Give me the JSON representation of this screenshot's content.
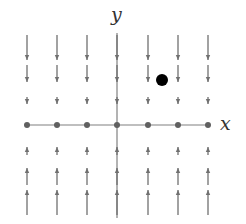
{
  "diagram": {
    "type": "vector-field",
    "axes": {
      "x_label": "x",
      "y_label": "y",
      "origin_px": [
        117,
        125
      ],
      "x_axis_px": [
        26,
        208
      ],
      "y_axis_px": [
        33,
        218
      ],
      "color": "#808080"
    },
    "grid": {
      "columns_px": [
        27,
        57,
        87,
        117,
        148,
        178,
        208
      ],
      "rows": [
        {
          "row": 3,
          "tail_y": 35,
          "tip_y": 60,
          "direction": "down"
        },
        {
          "row": 2,
          "tail_y": 65,
          "tip_y": 82,
          "direction": "down"
        },
        {
          "row": 1,
          "tail_y": 97,
          "tip_y": 104,
          "direction": "down"
        },
        {
          "row": 0,
          "y": 125,
          "direction": "none",
          "marker": "dot"
        },
        {
          "row": -1,
          "tail_y": 155,
          "tip_y": 147,
          "direction": "up"
        },
        {
          "row": -2,
          "tail_y": 185,
          "tip_y": 168,
          "direction": "up"
        },
        {
          "row": -3,
          "tail_y": 215,
          "tip_y": 190,
          "direction": "up"
        }
      ],
      "arrow_color": "#707070",
      "equilibrium_dot_color": "#606060"
    },
    "point": {
      "cx": 162,
      "cy": 80,
      "r": 6,
      "color": "#000000"
    }
  }
}
